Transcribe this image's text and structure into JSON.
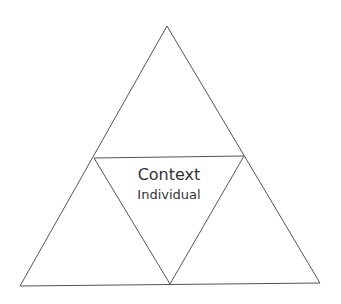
{
  "diagram": {
    "type": "subdivided-triangle",
    "line_color": "#555555",
    "background": "#ffffff",
    "labels": {
      "center_top": "Context",
      "center_bottom": "Individual"
    }
  }
}
